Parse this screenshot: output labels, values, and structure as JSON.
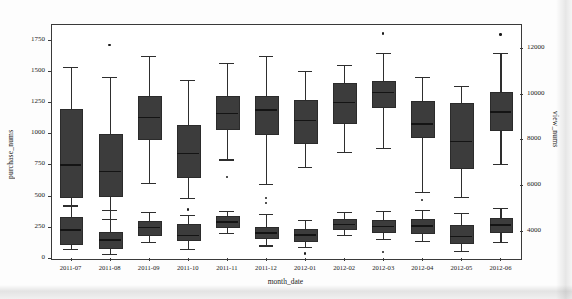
{
  "chart_data": {
    "type": "box",
    "title": "",
    "xlabel": "month_date",
    "ylabel": "purchase_nums",
    "ylabel_right": "view_nums",
    "categories": [
      "2011-07",
      "2011-08",
      "2011-09",
      "2011-10",
      "2011-11",
      "2011-12",
      "2012-01",
      "2012-02",
      "2012-03",
      "2012-04",
      "2012-05",
      "2012-06"
    ],
    "ylim": [
      0,
      1875
    ],
    "yticks": [
      0,
      250,
      500,
      750,
      1000,
      1250,
      1500,
      1750
    ],
    "ylim_right": [
      2800,
      13050
    ],
    "yticks_right": [
      4000,
      6000,
      8000,
      10000,
      12000
    ],
    "grid": false,
    "legend": "none",
    "box_color": "#3c3c3c",
    "series": [
      {
        "name": "purchase_nums",
        "axis": "left",
        "boxes": [
          {
            "category": "2011-07",
            "whisker_low": 135,
            "q1": 500,
            "median": 750,
            "q3": 1190,
            "whisker_high": 1530,
            "outliers": []
          },
          {
            "category": "2011-08",
            "whisker_low": 310,
            "q1": 505,
            "median": 700,
            "q3": 995,
            "whisker_high": 1450,
            "outliers": [
              1705
            ]
          },
          {
            "category": "2011-09",
            "whisker_low": 600,
            "q1": 960,
            "median": 1130,
            "q3": 1300,
            "whisker_high": 1620,
            "outliers": []
          },
          {
            "category": "2011-10",
            "whisker_low": 480,
            "q1": 660,
            "median": 840,
            "q3": 1065,
            "whisker_high": 1430,
            "outliers": [
              390
            ]
          },
          {
            "category": "2011-11",
            "whisker_low": 790,
            "q1": 1040,
            "median": 1165,
            "q3": 1300,
            "whisker_high": 1565,
            "outliers": [
              650
            ]
          },
          {
            "category": "2011-12",
            "whisker_low": 590,
            "q1": 1000,
            "median": 1190,
            "q3": 1300,
            "whisker_high": 1620,
            "outliers": [
              480
            ]
          },
          {
            "category": "2012-01",
            "whisker_low": 730,
            "q1": 930,
            "median": 1105,
            "q3": 1265,
            "whisker_high": 1500,
            "outliers": []
          },
          {
            "category": "2012-02",
            "whisker_low": 850,
            "q1": 1090,
            "median": 1250,
            "q3": 1400,
            "whisker_high": 1545,
            "outliers": []
          },
          {
            "category": "2012-03",
            "whisker_low": 880,
            "q1": 1215,
            "median": 1330,
            "q3": 1415,
            "whisker_high": 1640,
            "outliers": [
              1800
            ]
          },
          {
            "category": "2012-04",
            "whisker_low": 530,
            "q1": 975,
            "median": 1080,
            "q3": 1260,
            "whisker_high": 1450,
            "outliers": []
          },
          {
            "category": "2012-05",
            "whisker_low": 490,
            "q1": 730,
            "median": 940,
            "q3": 1245,
            "whisker_high": 1380,
            "outliers": []
          },
          {
            "category": "2012-06",
            "whisker_low": 755,
            "q1": 1030,
            "median": 1175,
            "q3": 1330,
            "whisker_high": 1640,
            "outliers": [
              1790
            ]
          }
        ]
      },
      {
        "name": "view_nums",
        "axis": "right",
        "boxes": [
          {
            "category": "2011-07",
            "whisker_low": 3180,
            "q1": 3450,
            "median": 4050,
            "q3": 4600,
            "whisker_high": 5100,
            "outliers": []
          },
          {
            "category": "2011-08",
            "whisker_low": 2980,
            "q1": 3280,
            "median": 3620,
            "q3": 3960,
            "whisker_high": 4900,
            "outliers": []
          },
          {
            "category": "2011-09",
            "whisker_low": 3520,
            "q1": 3870,
            "median": 4150,
            "q3": 4420,
            "whisker_high": 4820,
            "outliers": []
          },
          {
            "category": "2011-10",
            "whisker_low": 3180,
            "q1": 3620,
            "median": 3820,
            "q3": 4280,
            "whisker_high": 4700,
            "outliers": []
          },
          {
            "category": "2011-11",
            "whisker_low": 3900,
            "q1": 4180,
            "median": 4400,
            "q3": 4620,
            "whisker_high": 4880,
            "outliers": []
          },
          {
            "category": "2011-12",
            "whisker_low": 3350,
            "q1": 3700,
            "median": 3920,
            "q3": 4150,
            "whisker_high": 4720,
            "outliers": [
              5200
            ]
          },
          {
            "category": "2012-01",
            "whisker_low": 3280,
            "q1": 3600,
            "median": 3830,
            "q3": 4080,
            "whisker_high": 4480,
            "outliers": [
              3000
            ]
          },
          {
            "category": "2012-02",
            "whisker_low": 3820,
            "q1": 4120,
            "median": 4300,
            "q3": 4520,
            "whisker_high": 4800,
            "outliers": []
          },
          {
            "category": "2012-03",
            "whisker_low": 3650,
            "q1": 4000,
            "median": 4220,
            "q3": 4460,
            "whisker_high": 4880,
            "outliers": [
              3060
            ]
          },
          {
            "category": "2012-04",
            "whisker_low": 3550,
            "q1": 3950,
            "median": 4230,
            "q3": 4500,
            "whisker_high": 4900,
            "outliers": [
              5330
            ]
          },
          {
            "category": "2012-05",
            "whisker_low": 3120,
            "q1": 3520,
            "median": 3760,
            "q3": 4230,
            "whisker_high": 4780,
            "outliers": []
          },
          {
            "category": "2012-06",
            "whisker_low": 3500,
            "q1": 3980,
            "median": 4280,
            "q3": 4560,
            "whisker_high": 5000,
            "outliers": []
          }
        ]
      }
    ]
  }
}
